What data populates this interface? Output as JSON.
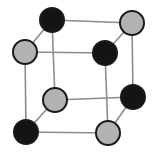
{
  "figure": {
    "name": "cubic-unit-cell-diagram",
    "width": 162,
    "height": 159,
    "background_color": "#ffffff"
  },
  "style": {
    "atom_radius": 11,
    "atom_outline_color": "#1a1a1a",
    "atom_outline_width": 2,
    "edge_color": "#8c8c8c",
    "edge_width": 1.6,
    "edge_color_front": "#8c8c8c",
    "type_a_fill": "#141414",
    "type_a_label": "black atom",
    "type_b_fill": "#b2b2b2",
    "type_b_label": "gray atom"
  },
  "atoms": [
    {
      "id": "back-top-left",
      "label": "back top left atom",
      "type": "black",
      "fill": "#141414",
      "cx": 52,
      "cy": 20,
      "r": 12
    },
    {
      "id": "back-top-right",
      "label": "back top right atom",
      "type": "gray",
      "fill": "#b2b2b2",
      "cx": 132,
      "cy": 23,
      "r": 12
    },
    {
      "id": "back-bottom-left",
      "label": "back bottom left atom",
      "type": "gray",
      "fill": "#b2b2b2",
      "cx": 55,
      "cy": 100,
      "r": 12
    },
    {
      "id": "back-bottom-right",
      "label": "back bottom right atom",
      "type": "black",
      "fill": "#141414",
      "cx": 133,
      "cy": 97,
      "r": 12
    },
    {
      "id": "front-top-left",
      "label": "front top left atom",
      "type": "gray",
      "fill": "#b2b2b2",
      "cx": 25,
      "cy": 52,
      "r": 12
    },
    {
      "id": "front-top-right",
      "label": "front top right atom",
      "type": "black",
      "fill": "#141414",
      "cx": 105,
      "cy": 53,
      "r": 12
    },
    {
      "id": "front-bottom-left",
      "label": "front bottom left atom",
      "type": "black",
      "fill": "#141414",
      "cx": 26,
      "cy": 132,
      "r": 12
    },
    {
      "id": "front-bottom-right",
      "label": "front bottom right atom",
      "type": "gray",
      "fill": "#b2b2b2",
      "cx": 108,
      "cy": 133,
      "r": 12
    }
  ],
  "edges": [
    {
      "id": "back-top",
      "label": "back top edge",
      "from": "back-top-left",
      "to": "back-top-right",
      "x1": 52,
      "y1": 20,
      "x2": 132,
      "y2": 23
    },
    {
      "id": "back-left",
      "label": "back left vertical edge",
      "from": "back-top-left",
      "to": "back-bottom-left",
      "x1": 52,
      "y1": 20,
      "x2": 55,
      "y2": 100
    },
    {
      "id": "back-right",
      "label": "back right vertical edge",
      "from": "back-top-right",
      "to": "back-bottom-right",
      "x1": 132,
      "y1": 23,
      "x2": 133,
      "y2": 97
    },
    {
      "id": "back-bottom",
      "label": "back bottom edge",
      "from": "back-bottom-left",
      "to": "back-bottom-right",
      "x1": 55,
      "y1": 100,
      "x2": 133,
      "y2": 97
    },
    {
      "id": "front-top",
      "label": "front top edge",
      "from": "front-top-left",
      "to": "front-top-right",
      "x1": 25,
      "y1": 52,
      "x2": 105,
      "y2": 53
    },
    {
      "id": "front-left",
      "label": "front left vertical edge",
      "from": "front-top-left",
      "to": "front-bottom-left",
      "x1": 25,
      "y1": 52,
      "x2": 26,
      "y2": 132
    },
    {
      "id": "front-right",
      "label": "front right vertical edge",
      "from": "front-top-right",
      "to": "front-bottom-right",
      "x1": 105,
      "y1": 53,
      "x2": 108,
      "y2": 133
    },
    {
      "id": "front-bottom",
      "label": "front bottom edge",
      "from": "front-bottom-left",
      "to": "front-bottom-right",
      "x1": 26,
      "y1": 132,
      "x2": 108,
      "y2": 133
    },
    {
      "id": "depth-top-left",
      "label": "top left depth edge",
      "from": "front-top-left",
      "to": "back-top-left",
      "x1": 25,
      "y1": 52,
      "x2": 52,
      "y2": 20
    },
    {
      "id": "depth-top-right",
      "label": "top right depth edge",
      "from": "front-top-right",
      "to": "back-top-right",
      "x1": 105,
      "y1": 53,
      "x2": 132,
      "y2": 23
    },
    {
      "id": "depth-bottom-left",
      "label": "bottom left depth edge",
      "from": "front-bottom-left",
      "to": "back-bottom-left",
      "x1": 26,
      "y1": 132,
      "x2": 55,
      "y2": 100
    },
    {
      "id": "depth-bottom-right",
      "label": "bottom right depth edge",
      "from": "front-bottom-right",
      "to": "back-bottom-right",
      "x1": 108,
      "y1": 133,
      "x2": 133,
      "y2": 97
    }
  ]
}
